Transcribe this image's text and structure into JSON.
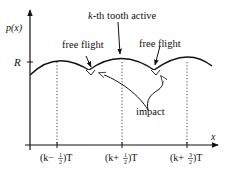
{
  "figure": {
    "y_axis_label": "p(x)",
    "x_axis_label": "x",
    "r_label": "R",
    "annotations": {
      "active": "k-th tooth active",
      "active_k": "k",
      "active_rest": "-th tooth active",
      "free_flight_left": "free flight",
      "free_flight_right": "free flight",
      "impact": "impact"
    },
    "ticks": [
      {
        "id": "tick-k-minus-half",
        "pre": "(k−",
        "num": "1",
        "den": "2",
        "post": ")T"
      },
      {
        "id": "tick-k-plus-half",
        "pre": "(k+",
        "num": "1",
        "den": "2",
        "post": ")T"
      },
      {
        "id": "tick-k-plus-three-halves",
        "pre": "(k+",
        "num": "3",
        "den": "2",
        "post": ")T"
      }
    ],
    "colors": {
      "line": "#111111",
      "background": "#ffffff"
    }
  }
}
